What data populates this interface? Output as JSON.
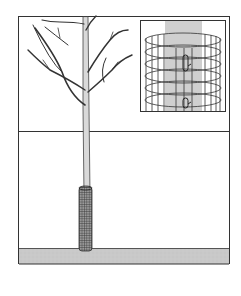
{
  "illustration": {
    "subject": "young tree with protective wire mesh guard around trunk base",
    "inset": "close-up of cylindrical wire mesh tree guard with clip fasteners",
    "colors": {
      "background": "#ffffff",
      "ground": "#c8c8c8",
      "trunk": "#d9d9d9",
      "outline": "#333333",
      "mesh": "#555555",
      "inset_trunk": "#cfcfcf"
    }
  }
}
